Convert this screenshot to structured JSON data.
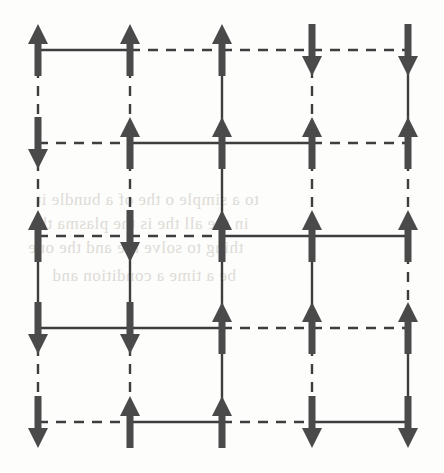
{
  "figure": {
    "width": 444,
    "height": 473,
    "background_color": "#fdfdfc",
    "ink_color": "#4a4a4a",
    "bond_color": "#3e3e3e",
    "bleed_color": "#d9d6d0"
  },
  "lattice": {
    "rows": 5,
    "cols": 5,
    "node_x": [
      38,
      130,
      222,
      312,
      408
    ],
    "node_y": [
      50,
      143,
      236,
      328,
      422
    ],
    "spin_up_label": "up",
    "spin_down_label": "down",
    "bond_solid_label": "solid",
    "bond_dashed_label": "dashed",
    "spins": [
      [
        "up",
        "up",
        "up",
        "down",
        "down"
      ],
      [
        "down",
        "up",
        "up",
        "up",
        "up"
      ],
      [
        "up",
        "down",
        "up",
        "up",
        "up"
      ],
      [
        "down",
        "down",
        "up",
        "up",
        "up"
      ],
      [
        "down",
        "up",
        "up",
        "down",
        "down"
      ]
    ],
    "horizontal_bonds": [
      [
        "solid",
        "dashed",
        "dashed",
        "dashed"
      ],
      [
        "dashed",
        "solid",
        "solid",
        "dashed"
      ],
      [
        "dashed",
        "dashed",
        "solid",
        "solid"
      ],
      [
        "solid",
        "solid",
        "dashed",
        "dashed"
      ],
      [
        "dashed",
        "solid",
        "dashed",
        "solid"
      ]
    ],
    "vertical_bonds": [
      [
        "dashed",
        "dashed",
        "solid",
        "dashed",
        "solid"
      ],
      [
        "dashed",
        "dashed",
        "solid",
        "dashed",
        "dashed"
      ],
      [
        "solid",
        "solid",
        "solid",
        "solid",
        "dashed"
      ],
      [
        "dashed",
        "dashed",
        "solid",
        "dashed",
        "solid"
      ]
    ]
  },
  "arrow": {
    "shaft_width": 7,
    "head_width": 20,
    "head_height": 20,
    "length": 52
  },
  "bond_style": {
    "stroke_width": 2.4,
    "dash_array": "10 8"
  },
  "bleed_text": {
    "lines": [
      {
        "text": "to a simple  o  the  of a bundle it",
        "x": 36,
        "y": 190
      },
      {
        "text": "in the all  the  is the plasma the",
        "x": 30,
        "y": 214
      },
      {
        "text": "thing  to solve   the and  the one",
        "x": 28,
        "y": 238
      },
      {
        "text": "be a  time   a  condition and",
        "x": 52,
        "y": 266
      }
    ]
  }
}
